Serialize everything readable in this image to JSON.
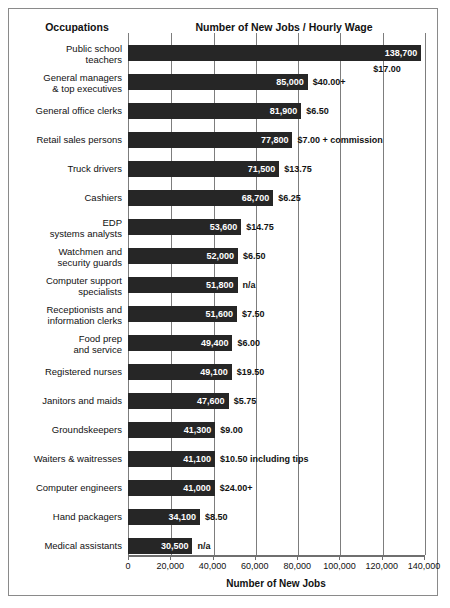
{
  "header": {
    "occupations_label": "Occupations",
    "chart_title": "Number of New Jobs / Hourly Wage"
  },
  "axis": {
    "xlabel": "Number of New Jobs",
    "ticks": [
      "0",
      "20,000",
      "40,000",
      "60,000",
      "80,000",
      "100,000",
      "120,000",
      "140,000"
    ]
  },
  "chart_data": {
    "type": "bar",
    "orientation": "horizontal",
    "title": "Number of New Jobs / Hourly Wage",
    "xlabel": "Number of New Jobs",
    "ylabel": "Occupations",
    "xlim": [
      0,
      140000
    ],
    "xticks": [
      0,
      20000,
      40000,
      60000,
      80000,
      100000,
      120000,
      140000
    ],
    "grid": true,
    "grid_axis": "x",
    "legend": false,
    "bar_color": "#262626",
    "categories": [
      "Public school teachers",
      "General managers & top executives",
      "General office clerks",
      "Retail sales persons",
      "Truck drivers",
      "Cashiers",
      "EDP systems analysts",
      "Watchmen and security guards",
      "Computer support specialists",
      "Receptionists and information clerks",
      "Food prep and service",
      "Registered nurses",
      "Janitors and maids",
      "Groundskeepers",
      "Waiters & waitresses",
      "Computer engineers",
      "Hand packagers",
      "Medical assistants"
    ],
    "values": [
      138700,
      85000,
      81900,
      77800,
      71500,
      68700,
      53600,
      52000,
      51800,
      51600,
      49400,
      49100,
      47600,
      41300,
      41100,
      41000,
      34100,
      30500
    ],
    "value_labels": [
      "138,700",
      "85,000",
      "81,900",
      "77,800",
      "71,500",
      "68,700",
      "53,600",
      "52,000",
      "51,800",
      "51,600",
      "49,400",
      "49,100",
      "47,600",
      "41,300",
      "41,100",
      "41,000",
      "34,100",
      "30,500"
    ],
    "wage_labels": [
      "$17.00",
      "$40.00+",
      "$6.50",
      "$7.00 + commission",
      "$13.75",
      "$6.25",
      "$14.75",
      "$6.50",
      "n/a",
      "$7.50",
      "$6.00",
      "$19.50",
      "$5.75",
      "$9.00",
      "$10.50 including tips",
      "$24.00+",
      "$8.50",
      "n/a"
    ]
  },
  "rows": [
    {
      "label_line1": "Public school",
      "label_line2": "teachers",
      "value": 138700,
      "value_label": "138,700",
      "wage": "$17.00",
      "wage_below": true
    },
    {
      "label_line1": "General managers",
      "label_line2": "& top executives",
      "value": 85000,
      "value_label": "85,000",
      "wage": "$40.00+",
      "wage_below": false
    },
    {
      "label_line1": "General office clerks",
      "label_line2": "",
      "value": 81900,
      "value_label": "81,900",
      "wage": "$6.50",
      "wage_below": false
    },
    {
      "label_line1": "Retail sales persons",
      "label_line2": "",
      "value": 77800,
      "value_label": "77,800",
      "wage": "$7.00 + commission",
      "wage_below": false
    },
    {
      "label_line1": "Truck drivers",
      "label_line2": "",
      "value": 71500,
      "value_label": "71,500",
      "wage": "$13.75",
      "wage_below": false
    },
    {
      "label_line1": "Cashiers",
      "label_line2": "",
      "value": 68700,
      "value_label": "68,700",
      "wage": "$6.25",
      "wage_below": false
    },
    {
      "label_line1": "EDP",
      "label_line2": "systems analysts",
      "value": 53600,
      "value_label": "53,600",
      "wage": "$14.75",
      "wage_below": false
    },
    {
      "label_line1": "Watchmen and",
      "label_line2": "security guards",
      "value": 52000,
      "value_label": "52,000",
      "wage": "$6.50",
      "wage_below": false
    },
    {
      "label_line1": "Computer support",
      "label_line2": "specialists",
      "value": 51800,
      "value_label": "51,800",
      "wage": "n/a",
      "wage_below": false
    },
    {
      "label_line1": "Receptionists and",
      "label_line2": "information clerks",
      "value": 51600,
      "value_label": "51,600",
      "wage": "$7.50",
      "wage_below": false
    },
    {
      "label_line1": "Food prep",
      "label_line2": "and service",
      "value": 49400,
      "value_label": "49,400",
      "wage": "$6.00",
      "wage_below": false
    },
    {
      "label_line1": "Registered nurses",
      "label_line2": "",
      "value": 49100,
      "value_label": "49,100",
      "wage": "$19.50",
      "wage_below": false
    },
    {
      "label_line1": "Janitors and maids",
      "label_line2": "",
      "value": 47600,
      "value_label": "47,600",
      "wage": "$5.75",
      "wage_below": false
    },
    {
      "label_line1": "Groundskeepers",
      "label_line2": "",
      "value": 41300,
      "value_label": "41,300",
      "wage": "$9.00",
      "wage_below": false
    },
    {
      "label_line1": "Waiters & waitresses",
      "label_line2": "",
      "value": 41100,
      "value_label": "41,100",
      "wage": "$10.50 including tips",
      "wage_below": false
    },
    {
      "label_line1": "Computer engineers",
      "label_line2": "",
      "value": 41000,
      "value_label": "41,000",
      "wage": "$24.00+",
      "wage_below": false
    },
    {
      "label_line1": "Hand packagers",
      "label_line2": "",
      "value": 34100,
      "value_label": "34,100",
      "wage": "$8.50",
      "wage_below": false
    },
    {
      "label_line1": "Medical assistants",
      "label_line2": "",
      "value": 30500,
      "value_label": "30,500",
      "wage": "n/a",
      "wage_below": false
    }
  ]
}
